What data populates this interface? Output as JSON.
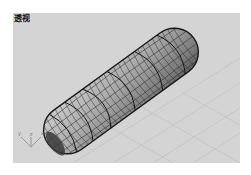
{
  "viewport": {
    "title": "透视",
    "background": "#d4d4d4",
    "grid_color": "#bdbdbd",
    "object": {
      "type": "capsule-mesh",
      "fill": "#9a9a9a",
      "highlight": "#c8c8c8",
      "wire_color": "#2a2a2a"
    },
    "axis_labels": {
      "x": "x",
      "y": "y",
      "z": "z"
    }
  }
}
